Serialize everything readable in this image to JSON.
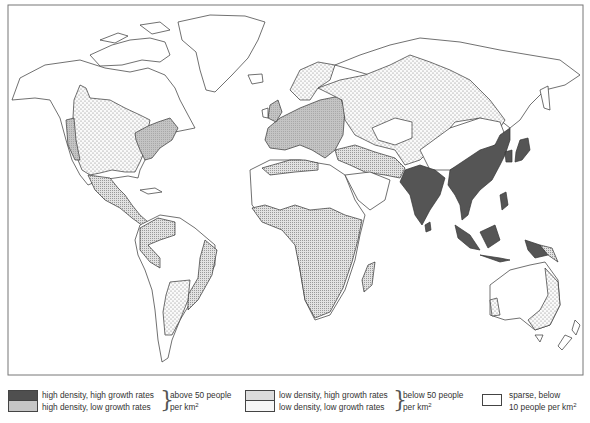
{
  "map": {
    "title": "World population density and growth",
    "colors": {
      "high_density_high_growth": "#555555",
      "high_density_low_growth": "#bdbdbd",
      "low_density_high_growth": "#d9d9d9",
      "low_density_low_growth": "#f2f2f2",
      "sparse": "#ffffff",
      "outline": "#333333"
    },
    "regions": [
      {
        "name": "North America interior",
        "category": "low_density_low_growth"
      },
      {
        "name": "Eastern USA",
        "category": "high_density_low_growth"
      },
      {
        "name": "US West Coast",
        "category": "high_density_low_growth"
      },
      {
        "name": "Mexico and Central America",
        "category": "low_density_high_growth"
      },
      {
        "name": "South America north",
        "category": "low_density_high_growth"
      },
      {
        "name": "Brazil coast",
        "category": "low_density_high_growth"
      },
      {
        "name": "Argentina",
        "category": "low_density_low_growth"
      },
      {
        "name": "Europe",
        "category": "high_density_low_growth"
      },
      {
        "name": "Scandinavia and Russia",
        "category": "low_density_low_growth"
      },
      {
        "name": "North Africa coast",
        "category": "low_density_high_growth"
      },
      {
        "name": "Sub-Saharan Africa",
        "category": "low_density_high_growth"
      },
      {
        "name": "Middle East",
        "category": "low_density_high_growth"
      },
      {
        "name": "India",
        "category": "high_density_high_growth"
      },
      {
        "name": "China and Southeast Asia",
        "category": "high_density_high_growth"
      },
      {
        "name": "Japan",
        "category": "high_density_high_growth"
      },
      {
        "name": "Indonesia",
        "category": "high_density_high_growth"
      },
      {
        "name": "Eastern Australia",
        "category": "low_density_low_growth"
      },
      {
        "name": "Siberia, Sahara, Greenland, Canada north, Central Asia",
        "category": "sparse"
      }
    ]
  },
  "legend": {
    "groups": [
      {
        "items": [
          {
            "key": "high_density_high_growth",
            "label": "high density, high growth rates"
          },
          {
            "key": "high_density_low_growth",
            "label": "high density, low growth rates"
          }
        ],
        "range_line1": "above 50 people",
        "range_line2": "per km",
        "range_sup": "2"
      },
      {
        "items": [
          {
            "key": "low_density_high_growth",
            "label": "low density, high growth rates"
          },
          {
            "key": "low_density_low_growth",
            "label": "low density, low growth rates"
          }
        ],
        "range_line1": "below 50 people",
        "range_line2": "per km",
        "range_sup": "2"
      },
      {
        "items": [
          {
            "key": "sparse",
            "label_line1": "sparse, below",
            "label_line2": "10 people per km",
            "label_sup": "2"
          }
        ]
      }
    ]
  }
}
